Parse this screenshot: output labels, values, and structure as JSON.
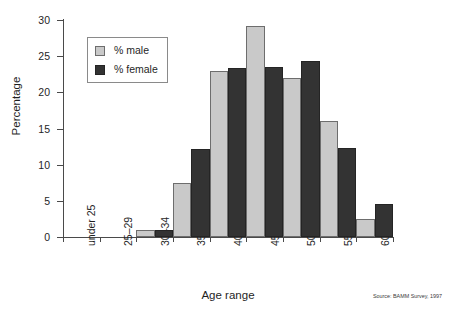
{
  "chart_data": {
    "type": "bar",
    "title": "",
    "xlabel": "Age range",
    "ylabel": "Percentage",
    "ylim": [
      0,
      30
    ],
    "yticks": [
      0,
      5,
      10,
      15,
      20,
      25,
      30
    ],
    "grid": false,
    "legend_position": "upper-left-inside",
    "categories": [
      "under 25",
      "25–29",
      "30–34",
      "35–39",
      "40–44",
      "45–49",
      "50–54",
      "55–59",
      "60+"
    ],
    "series": [
      {
        "name": "% male",
        "color": "#c9c9c9",
        "values": [
          0,
          0,
          1.0,
          7.5,
          23.0,
          29.2,
          22.0,
          16.0,
          2.5
        ]
      },
      {
        "name": "% female",
        "color": "#333333",
        "values": [
          0,
          0,
          1.0,
          12.1,
          23.4,
          23.5,
          24.3,
          12.3,
          4.5
        ]
      }
    ],
    "annotations": [
      "Source: BAMM Survey, 1997"
    ]
  },
  "axes": {
    "y_title": "Percentage",
    "x_title": "Age range",
    "y_tick_labels": [
      "0",
      "5",
      "10",
      "15",
      "20",
      "25",
      "30"
    ],
    "x_tick_labels": [
      "under 25",
      "25–29",
      "30–34",
      "35–39",
      "40–44",
      "45–49",
      "50–54",
      "55–59",
      "60+"
    ]
  },
  "legend": {
    "entries": [
      {
        "label": "% male",
        "swatch": "light-gray-square"
      },
      {
        "label": "% female",
        "swatch": "dark-square"
      }
    ]
  },
  "footer": {
    "source": "Source: BAMM Survey, 1997"
  },
  "colors": {
    "male": "#c9c9c9",
    "female": "#333333",
    "axis": "#4a4a4a",
    "text": "#1f1f1f",
    "background": "#ffffff"
  }
}
